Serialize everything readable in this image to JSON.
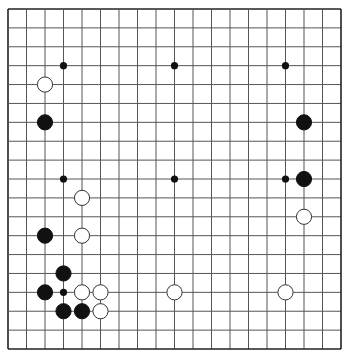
{
  "board": {
    "size": 19,
    "origin_x": 8,
    "origin_y": 9,
    "spacing_x": 18.5,
    "spacing_y": 18.89,
    "line_color": "#555555",
    "border_color": "#222222",
    "background": "#ffffff",
    "star_points": [
      [
        3,
        3
      ],
      [
        9,
        3
      ],
      [
        15,
        3
      ],
      [
        3,
        9
      ],
      [
        9,
        9
      ],
      [
        15,
        9
      ],
      [
        3,
        15
      ],
      [
        9,
        15
      ],
      [
        15,
        15
      ]
    ],
    "stone_radius": 7.6
  },
  "stones": [
    {
      "color": "white",
      "col": 2,
      "row": 4
    },
    {
      "color": "black",
      "col": 2,
      "row": 6
    },
    {
      "color": "black",
      "col": 16,
      "row": 6
    },
    {
      "color": "black",
      "col": 16,
      "row": 9
    },
    {
      "color": "white",
      "col": 4,
      "row": 10
    },
    {
      "color": "white",
      "col": 16,
      "row": 11
    },
    {
      "color": "black",
      "col": 2,
      "row": 12
    },
    {
      "color": "white",
      "col": 4,
      "row": 12
    },
    {
      "color": "black",
      "col": 3,
      "row": 14
    },
    {
      "color": "black",
      "col": 2,
      "row": 15
    },
    {
      "color": "white",
      "col": 4,
      "row": 15
    },
    {
      "color": "white",
      "col": 5,
      "row": 15
    },
    {
      "color": "white",
      "col": 9,
      "row": 15
    },
    {
      "color": "white",
      "col": 15,
      "row": 15
    },
    {
      "color": "black",
      "col": 3,
      "row": 16
    },
    {
      "color": "black",
      "col": 4,
      "row": 16
    },
    {
      "color": "white",
      "col": 5,
      "row": 16
    }
  ]
}
